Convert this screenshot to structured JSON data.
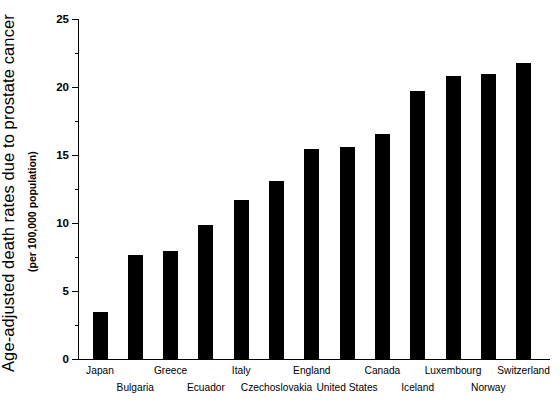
{
  "chart_data": {
    "type": "bar",
    "title": "",
    "ylabel": "Age-adjusted death rates due to prostate cancer",
    "ylabel_sub": "(per 100,000 population)",
    "xlabel": "",
    "categories": [
      "Japan",
      "Bulgaria",
      "Greece",
      "Ecuador",
      "Italy",
      "Czechoslovakia",
      "England",
      "United States",
      "Canada",
      "Iceland",
      "Luxembourg",
      "Norway",
      "Switzerland"
    ],
    "values": [
      3.5,
      7.7,
      8.0,
      9.9,
      11.7,
      13.1,
      15.5,
      15.6,
      16.6,
      19.7,
      20.8,
      21.0,
      21.8
    ],
    "ylim": [
      0,
      25
    ],
    "ytick_values": [
      0,
      5,
      10,
      15,
      20,
      25
    ],
    "ytick_labels": [
      "0",
      "5",
      "10",
      "15",
      "20",
      "25"
    ],
    "yminor_values": [
      2.5,
      7.5,
      12.5,
      17.5,
      22.5
    ],
    "grid": false,
    "legend": false,
    "bar_color": "#000000",
    "background_color": "#ffffff",
    "label_rows": [
      0,
      1,
      0,
      1,
      0,
      1,
      0,
      1,
      0,
      1,
      0,
      1,
      0
    ]
  }
}
